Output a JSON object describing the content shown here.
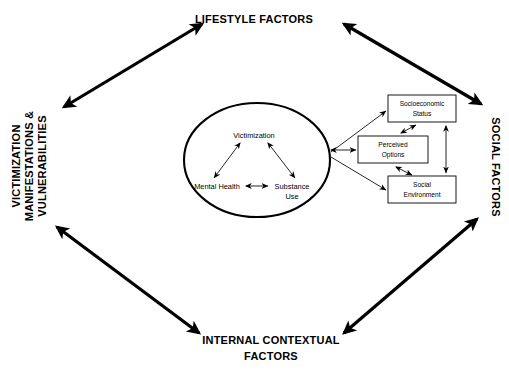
{
  "diagram": {
    "outer_labels": {
      "top": {
        "name": "lifestyle-factors",
        "lines": [
          "LIFESTYLE FACTORS"
        ],
        "orientation": "horizontal"
      },
      "left": {
        "name": "victimization-manifestations-vulnerabilities",
        "lines": [
          "VICTIMIZATION",
          "MANIFESTATIONS &",
          "VULNERABILITIES"
        ],
        "orientation": "vertical-up"
      },
      "right": {
        "name": "social-factors",
        "lines": [
          "SOCIAL FACTORS"
        ],
        "orientation": "vertical-down"
      },
      "bottom": {
        "name": "internal-contextual-factors",
        "lines": [
          "INTERNAL CONTEXTUAL",
          "FACTORS"
        ],
        "orientation": "horizontal"
      }
    },
    "core": {
      "shape": "ellipse",
      "nodes": [
        {
          "id": "victimization",
          "label": "Victimization",
          "x": 254,
          "y": 135
        },
        {
          "id": "mental-health",
          "label": "Mental Health",
          "x": 217,
          "y": 186
        },
        {
          "id": "substance-use",
          "label": "Substance",
          "label2": "Use",
          "x": 291,
          "y": 186
        }
      ]
    },
    "boxes": [
      {
        "id": "socioeconomic-status",
        "line1": "Socioeconomic",
        "line2": "Status"
      },
      {
        "id": "perceived-options",
        "line1": "Perceived",
        "line2": "Options"
      },
      {
        "id": "social-environment",
        "line1": "Social",
        "line2": "Environment"
      }
    ],
    "colors": {
      "stroke": "#000000",
      "background": "#ffffff",
      "box_fill": "#ffffff"
    }
  }
}
